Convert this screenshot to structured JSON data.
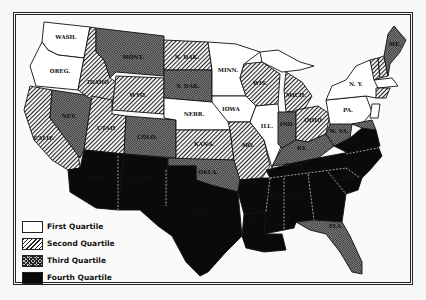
{
  "title": "",
  "legend": {
    "items": [
      {
        "key": "q1",
        "label": "First Quartile"
      },
      {
        "key": "q2",
        "label": "Second Quartile"
      },
      {
        "key": "q3",
        "label": "Third Quartile"
      },
      {
        "key": "q4",
        "label": "Fourth Quartile"
      }
    ]
  },
  "states": {
    "WASH": {
      "label": "WASH.",
      "quartile": "First"
    },
    "OREG": {
      "label": "OREG.",
      "quartile": "First"
    },
    "CALIF": {
      "label": "CALIF.",
      "quartile": "Second"
    },
    "NEV": {
      "label": "NEV.",
      "quartile": "Third"
    },
    "IDAHO": {
      "label": "IDAHO",
      "quartile": "Second"
    },
    "MONT": {
      "label": "MONT.",
      "quartile": "Third"
    },
    "WYO": {
      "label": "WYO.",
      "quartile": "Second"
    },
    "UTAH": {
      "label": "UTAH",
      "quartile": "Second"
    },
    "COLO": {
      "label": "COLO.",
      "quartile": "Third"
    },
    "ARIZ": {
      "label": "ARIZ.",
      "quartile": "Fourth"
    },
    "NMEX": {
      "label": "N. MEX.",
      "quartile": "Fourth"
    },
    "NDAK": {
      "label": "N. DAK.",
      "quartile": "Second"
    },
    "SDAK": {
      "label": "S. DAK.",
      "quartile": "Third"
    },
    "NEBR": {
      "label": "NEBR.",
      "quartile": "First"
    },
    "KANS": {
      "label": "KANS.",
      "quartile": "Second"
    },
    "OKLA": {
      "label": "OKLA.",
      "quartile": "Third"
    },
    "TEXAS": {
      "label": "TEXAS",
      "quartile": "Fourth"
    },
    "MINN": {
      "label": "MINN.",
      "quartile": "First"
    },
    "IOWA": {
      "label": "IOWA",
      "quartile": "First"
    },
    "MO": {
      "label": "MO.",
      "quartile": "Second"
    },
    "ARK": {
      "label": "ARK.",
      "quartile": "Fourth"
    },
    "LA": {
      "label": "LA.",
      "quartile": "Fourth"
    },
    "WIS": {
      "label": "WIS.",
      "quartile": "Second"
    },
    "ILL": {
      "label": "ILL.",
      "quartile": "First"
    },
    "MICH": {
      "label": "MICH.",
      "quartile": "Second"
    },
    "IND": {
      "label": "IND.",
      "quartile": "Third"
    },
    "OHIO": {
      "label": "OHIO",
      "quartile": "Second"
    },
    "KY": {
      "label": "KY.",
      "quartile": "Third"
    },
    "TENN": {
      "label": "TENN.",
      "quartile": "Fourth"
    },
    "MISS": {
      "label": "MISS.",
      "quartile": "Fourth"
    },
    "ALA": {
      "label": "ALA.",
      "quartile": "Fourth"
    },
    "GA": {
      "label": "GA.",
      "quartile": "Fourth"
    },
    "FLA": {
      "label": "FLA.",
      "quartile": "Third"
    },
    "SCAR": {
      "label": "S. CAR.",
      "quartile": "Fourth"
    },
    "NCAR": {
      "label": "N. CAR.",
      "quartile": "Fourth"
    },
    "VA": {
      "label": "VA.",
      "quartile": "Fourth"
    },
    "WVA": {
      "label": "W. VA.",
      "quartile": "Third"
    },
    "PA": {
      "label": "PA.",
      "quartile": "First"
    },
    "NY": {
      "label": "N. Y.",
      "quartile": "First"
    },
    "VT": {
      "label": "VT.",
      "quartile": "Second"
    },
    "NH": {
      "label": "N. H.",
      "quartile": "Second"
    },
    "ME": {
      "label": "ME.",
      "quartile": "Third"
    },
    "MASS": {
      "label": "MASS.",
      "quartile": "First"
    }
  }
}
